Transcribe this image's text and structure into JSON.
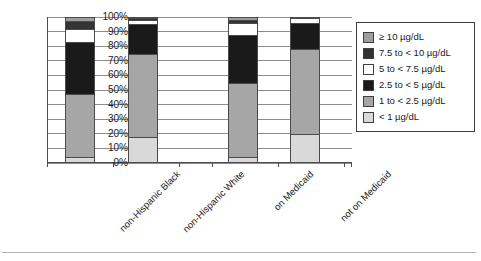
{
  "chart_data": {
    "type": "bar",
    "subtype": "stacked-percent",
    "title": "",
    "xlabel": "",
    "ylabel": "",
    "ylim": [
      0,
      100
    ],
    "ytick_labels": [
      "0%",
      "10%",
      "20%",
      "30%",
      "40%",
      "50%",
      "60%",
      "70%",
      "80%",
      "90%",
      "100%"
    ],
    "ytick_values": [
      0,
      10,
      20,
      30,
      40,
      50,
      60,
      70,
      80,
      90,
      100
    ],
    "grid": true,
    "legend_position": "right",
    "categories": [
      "non-Hispanic Black",
      "non-Hispanic White",
      "on Medicaid",
      "not on Medicaid"
    ],
    "series": [
      {
        "name": "< 1 µg/dL",
        "color": "#d9d9d9",
        "values": [
          4,
          18,
          4,
          20
        ]
      },
      {
        "name": "1 to < 2.5 µg/dL",
        "color": "#a6a6a6",
        "values": [
          43,
          57,
          51,
          58
        ]
      },
      {
        "name": "2.5 to < 5 µg/dL",
        "color": "#1a1a1a",
        "values": [
          36,
          20,
          33,
          18
        ]
      },
      {
        "name": "5 to < 7.5 µg/dL",
        "color": "#ffffff",
        "values": [
          9,
          3,
          8,
          3
        ]
      },
      {
        "name": "7.5 to < 10 µg/dL",
        "color": "#333333",
        "values": [
          5,
          1,
          2,
          1
        ]
      },
      {
        "name": "≥ 10 µg/dL",
        "color": "#9e9e9e",
        "values": [
          3,
          1,
          2,
          0
        ]
      }
    ]
  },
  "legend": {
    "entries": [
      {
        "label": "≥ 10 µg/dL",
        "color": "#9e9e9e"
      },
      {
        "label": "7.5 to < 10 µg/dL",
        "color": "#333333"
      },
      {
        "label": "5 to < 7.5 µg/dL",
        "color": "#ffffff"
      },
      {
        "label": "2.5 to < 5 µg/dL",
        "color": "#1a1a1a"
      },
      {
        "label": "1 to < 2.5 µg/dL",
        "color": "#a6a6a6"
      },
      {
        "label": "< 1 µg/dL",
        "color": "#d9d9d9"
      }
    ]
  },
  "axis": {
    "y_labels": [
      "100%",
      "90%",
      "80%",
      "70%",
      "60%",
      "50%",
      "40%",
      "30%",
      "20%",
      "10%",
      "0%"
    ],
    "x_labels": [
      "non-Hispanic Black",
      "non-Hispanic White",
      "on Medicaid",
      "not on Medicaid"
    ]
  }
}
